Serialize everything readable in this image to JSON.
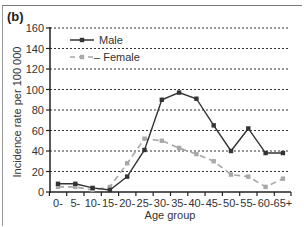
{
  "panel_label": "(b)",
  "chart_data": {
    "type": "line",
    "title": "",
    "xlabel": "Age group",
    "ylabel": "Incidence rate per 100 000",
    "ylim": [
      0,
      160
    ],
    "yticks": [
      0,
      20,
      40,
      60,
      80,
      100,
      120,
      140,
      160
    ],
    "grid": true,
    "legend_position": "upper left",
    "categories": [
      "0-",
      "5-",
      "10-",
      "15-",
      "20-",
      "25-",
      "30-",
      "35-",
      "40-",
      "45-",
      "50-",
      "55-",
      "60-",
      "65+"
    ],
    "series": [
      {
        "name": "Male",
        "color": "#333333",
        "style": "solid",
        "marker": "square",
        "values": [
          8,
          8,
          4,
          2,
          15,
          41,
          90,
          97,
          91,
          65,
          40,
          62,
          38,
          38
        ]
      },
      {
        "name": "Female",
        "color": "#a8a8a8",
        "style": "dashed",
        "marker": "square",
        "values": [
          5,
          5,
          2,
          5,
          28,
          52,
          50,
          43,
          37,
          30,
          17,
          15,
          5,
          13
        ]
      }
    ]
  }
}
